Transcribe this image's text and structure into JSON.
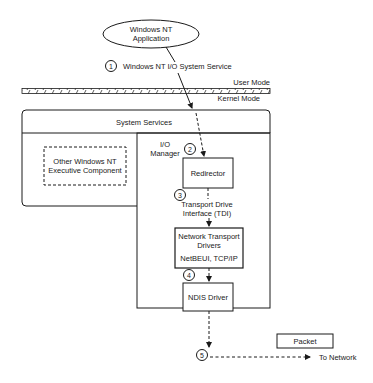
{
  "diagram": {
    "application": {
      "line1": "Windows NT",
      "line2": "Application"
    },
    "step1": {
      "number": "1",
      "label": "Windows NT I/O System Service"
    },
    "modes": {
      "user": "User Mode",
      "kernel": "Kernel Mode"
    },
    "system_services": {
      "label": "System Services"
    },
    "other_component": {
      "line1": "Other Windows NT",
      "line2": "Executive Component"
    },
    "io_manager": {
      "line1": "I/O",
      "line2": "Manager"
    },
    "step2": {
      "number": "2"
    },
    "redirector": {
      "label": "Redirector"
    },
    "step3": {
      "number": "3",
      "line1": "Transport Drive",
      "line2": "Interface (TDI)"
    },
    "network_transport": {
      "line1": "Network Transport",
      "line2": "Drivers",
      "line3": "NetBEUI, TCP/IP"
    },
    "step4": {
      "number": "4"
    },
    "ndis": {
      "label": "NDIS Driver"
    },
    "step5": {
      "number": "5"
    },
    "packet": {
      "label": "Packet"
    },
    "to_network": {
      "label": "To Network"
    }
  }
}
